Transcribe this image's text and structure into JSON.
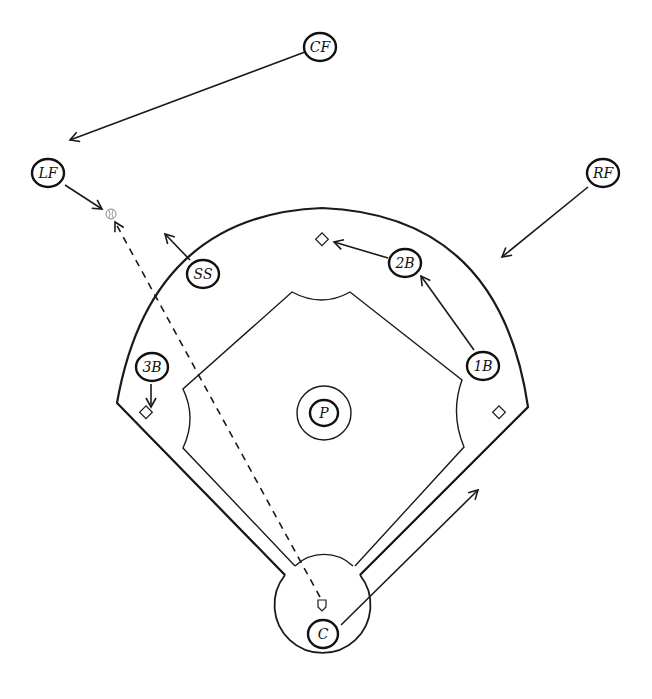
{
  "diagram": {
    "colors": {
      "line": "#1a1a1a",
      "background": "#ffffff",
      "ball": "#888888"
    },
    "players": [
      {
        "id": "cf",
        "label": "CF",
        "x": 320,
        "y": 47
      },
      {
        "id": "lf",
        "label": "LF",
        "x": 48,
        "y": 173
      },
      {
        "id": "rf",
        "label": "RF",
        "x": 603,
        "y": 173
      },
      {
        "id": "ss",
        "label": "SS",
        "x": 203,
        "y": 274
      },
      {
        "id": "2b",
        "label": "2B",
        "x": 405,
        "y": 263
      },
      {
        "id": "3b",
        "label": "3B",
        "x": 152,
        "y": 367
      },
      {
        "id": "1b",
        "label": "1B",
        "x": 483,
        "y": 366
      },
      {
        "id": "p",
        "label": "P",
        "x": 324,
        "y": 413
      },
      {
        "id": "c",
        "label": "C",
        "x": 323,
        "y": 634
      }
    ],
    "bases": [
      {
        "id": "second-base",
        "x": 322,
        "y": 240
      },
      {
        "id": "third-base",
        "x": 146,
        "y": 413
      },
      {
        "id": "first-base",
        "x": 499,
        "y": 413
      }
    ],
    "home_plate": {
      "x": 322,
      "y": 605
    },
    "ball": {
      "x": 111,
      "y": 214
    },
    "movements": [
      {
        "from": "CF",
        "x1": 305,
        "y1": 52,
        "x2": 70,
        "y2": 140,
        "style": "solid"
      },
      {
        "from": "LF",
        "x1": 65,
        "y1": 185,
        "x2": 102,
        "y2": 209,
        "style": "solid"
      },
      {
        "from": "RF",
        "x1": 588,
        "y1": 187,
        "x2": 502,
        "y2": 257,
        "style": "solid"
      },
      {
        "from": "SS",
        "x1": 190,
        "y1": 260,
        "x2": 165,
        "y2": 234,
        "style": "solid"
      },
      {
        "from": "2B",
        "x1": 388,
        "y1": 258,
        "x2": 334,
        "y2": 242,
        "style": "solid"
      },
      {
        "from": "1B",
        "x1": 474,
        "y1": 350,
        "x2": 421,
        "y2": 276,
        "style": "solid"
      },
      {
        "from": "3B",
        "x1": 151,
        "y1": 384,
        "x2": 151,
        "y2": 407,
        "style": "solid"
      },
      {
        "from": "C",
        "x1": 341,
        "y1": 625,
        "x2": 478,
        "y2": 490,
        "style": "solid"
      },
      {
        "from": "home-throw",
        "x1": 320,
        "y1": 597,
        "x2": 115,
        "y2": 222,
        "style": "dashed"
      }
    ]
  }
}
